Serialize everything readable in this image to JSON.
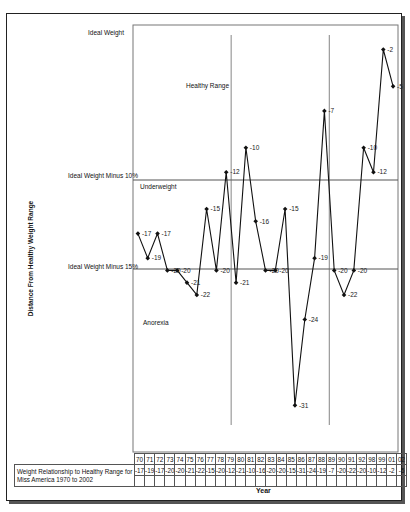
{
  "chart_data": {
    "type": "line",
    "title": "",
    "xlabel": "Year",
    "ylabel": "Distance From Healthy Weight Range",
    "categories": [
      "70",
      "71",
      "72",
      "73",
      "74",
      "75",
      "76",
      "77",
      "78",
      "79",
      "80",
      "81",
      "82",
      "83",
      "84",
      "85",
      "86",
      "87",
      "88",
      "89",
      "90",
      "91",
      "92",
      "98",
      "99",
      "01",
      "02"
    ],
    "series": [
      {
        "name": "Weight Relationship to Healthy Range for Miss America 1970 to 2002",
        "values": [
          -17,
          -19,
          -17,
          -20,
          -20,
          -21,
          -22,
          -15,
          -20,
          -12,
          -21,
          -10,
          -16,
          -20,
          -20,
          -15,
          -31,
          -24,
          -19,
          -7,
          -20,
          -22,
          -20,
          -10,
          -12,
          -2,
          -5
        ]
      }
    ],
    "ylim": [
      0,
      -35
    ],
    "y_reference_lines": [
      {
        "label": "Ideal Weight",
        "value": 0
      },
      {
        "label": "Ideal Weight Minus 10%",
        "value": -12.7
      },
      {
        "label": "Ideal Weight Minus 15%",
        "value": -20
      }
    ],
    "region_labels": [
      "Healthy Range",
      "Underweight",
      "Anorexia"
    ],
    "vertical_lines_between": [
      [
        "79",
        "80"
      ],
      [
        "89",
        "90"
      ]
    ],
    "data_labels": true,
    "legend": "data table below chart",
    "grid": false
  },
  "labels": {
    "ideal_weight": "Ideal Weight",
    "minus10": "Ideal Weight Minus 10%",
    "minus15": "Ideal Weight Minus 15%",
    "healthy_range": "Healthy Range",
    "underweight": "Underweight",
    "anorexia": "Anorexia",
    "ylabel": "Distance From Healthy Weight Range",
    "xlabel": "Year",
    "table_row_header": "Weight Relationship to Healthy Range for Miss America 1970 to 2002"
  }
}
